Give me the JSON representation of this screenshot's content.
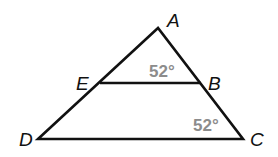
{
  "figure": {
    "type": "triangle-with-parallel-segment",
    "stroke_color": "#111111",
    "angle_label_color": "#8c8c8c",
    "vertices": {
      "A": {
        "label": "A",
        "x": 158,
        "y": 28
      },
      "B": {
        "label": "B",
        "x": 201,
        "y": 83
      },
      "C": {
        "label": "C",
        "x": 243,
        "y": 139
      },
      "D": {
        "label": "D",
        "x": 38,
        "y": 139
      },
      "E": {
        "label": "E",
        "x": 100,
        "y": 83
      }
    },
    "segments": [
      "AD",
      "AC",
      "DC",
      "EB"
    ],
    "angles": [
      {
        "at": "B",
        "name": "angle-ABE",
        "label": "52°"
      },
      {
        "at": "C",
        "name": "angle-ACD",
        "label": "52°"
      }
    ]
  }
}
